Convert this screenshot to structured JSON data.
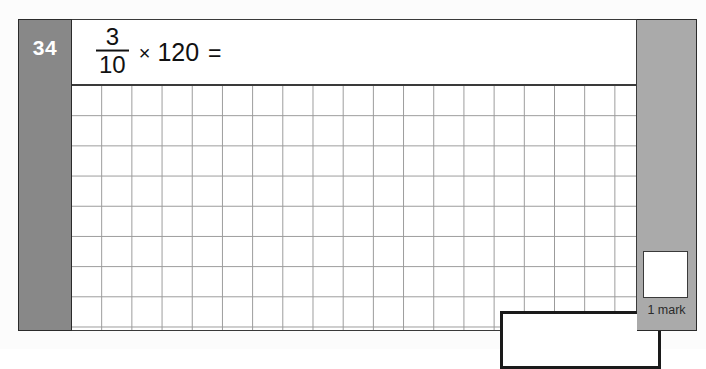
{
  "question": {
    "number": "34",
    "expression": {
      "fraction": {
        "numerator": "3",
        "denominator": "10"
      },
      "multiply_symbol": "×",
      "operand": "120",
      "equals_symbol": "="
    },
    "answer_value": ""
  },
  "marks": {
    "label": "1 mark",
    "box_value": ""
  },
  "colors": {
    "number_band": "#888888",
    "mark_band": "#aaaaaa",
    "grid_line": "#9a9a9a",
    "border": "#3a3a3a",
    "answer_border": "#1a1a1a",
    "page_background": "#fcfcfc"
  },
  "grid": {
    "columns": 19,
    "rows": 8,
    "cell_size_px": "30"
  }
}
